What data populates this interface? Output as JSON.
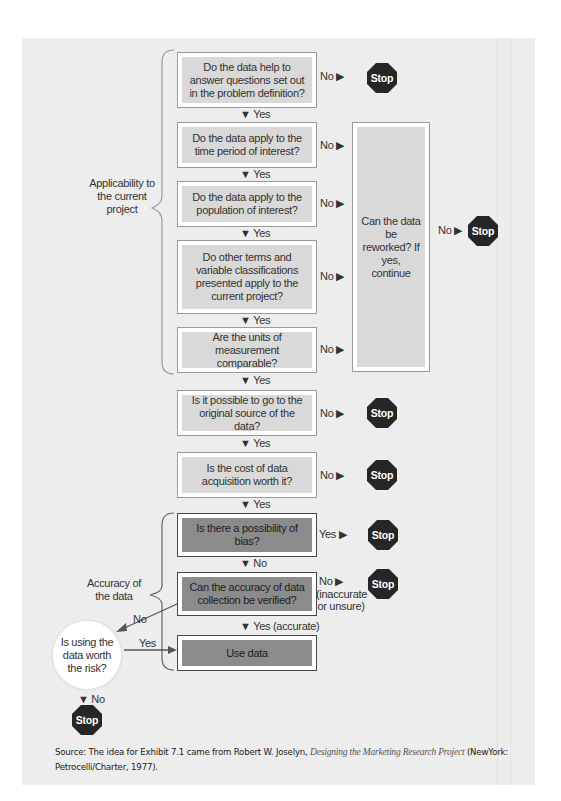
{
  "figure": {
    "source_prefix": "Source: The idea for Exhibit 7.1 came from Robert W. Joselyn, ",
    "source_title": "Designing the Marketing Research Project",
    "source_suffix": " (NewYork: Petrocelli/Charter, 1977).",
    "colors": {
      "panel_bg": "#ededed",
      "light_box_fill": "#d9d9d9",
      "dark_box_fill": "#8b8b8b",
      "stop_fill": "#262626"
    }
  },
  "groups": {
    "applicability": "Applicability to the current project",
    "accuracy": "Accuracy of the data"
  },
  "questions": [
    {
      "id": "q1",
      "text": "Do the data help to answer questions set out in the problem definition?",
      "no_label": "No ▶",
      "yes_label": "▼ Yes"
    },
    {
      "id": "q2",
      "text": "Do the data apply to the time period of interest?",
      "no_label": "No ▶",
      "yes_label": "▼ Yes"
    },
    {
      "id": "q3",
      "text": "Do the data apply to the population of interest?",
      "no_label": "No ▶",
      "yes_label": "▼ Yes"
    },
    {
      "id": "q4",
      "text": "Do other terms and variable classifications presented apply to the current project?",
      "no_label": "No ▶",
      "yes_label": "▼ Yes"
    },
    {
      "id": "q5",
      "text": "Are the units of measurement comparable?",
      "no_label": "No ▶",
      "yes_label": "▼ Yes"
    },
    {
      "id": "q6",
      "text": "Is it possible to go to the original source of the data?",
      "no_label": "No ▶",
      "yes_label": "▼ Yes"
    },
    {
      "id": "q7",
      "text": "Is the cost of data acquisition worth it?",
      "no_label": "No ▶",
      "yes_label": "▼ Yes"
    },
    {
      "id": "q8",
      "text": "Is there a possibility of bias?",
      "branch_label": "Yes ▶",
      "next_label": "▼ No"
    },
    {
      "id": "q9",
      "text": "Can the accuracy of data collection be verified?",
      "no_label": "No ▶",
      "no_detail": "(inaccurate or unsure)",
      "yes_label": "▼ Yes (accurate)"
    }
  ],
  "rework": {
    "text": "Can the data be reworked? If yes, continue",
    "no_label": "No ▶"
  },
  "use_data": "Use data",
  "risk": {
    "text": "Is using the data worth the risk?",
    "in_label": "No",
    "yes_label": "Yes",
    "no_label": "▼ No"
  },
  "stop_label": "Stop"
}
